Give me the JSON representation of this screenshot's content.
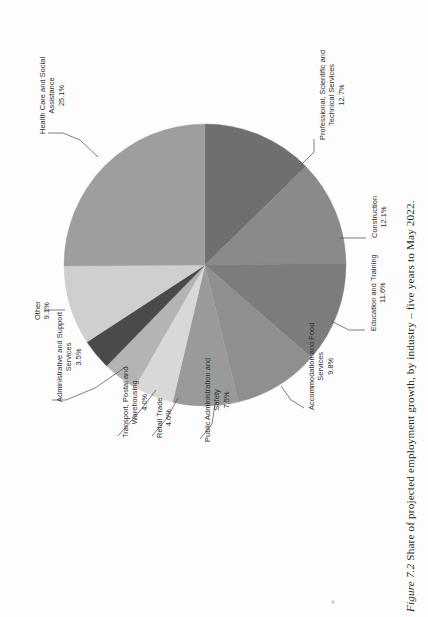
{
  "figure": {
    "caption_number": "Figure 7.2",
    "caption_text": "Share of projected employment growth, by industry – five years to May 2022."
  },
  "chart_data": {
    "type": "pie",
    "title": "Share of projected employment growth, by industry – five years to May 2022.",
    "xlabel": "",
    "ylabel": "",
    "units": "percent",
    "legend_position": "none",
    "labels_position": "outside-with-leader-lines",
    "grid": false,
    "rotation_deg": -90,
    "categories": [
      "Professional, Scientific and Technical Services",
      "Construction",
      "Education and Training",
      "Accommodation and Food Services",
      "Public Administration and Safety",
      "Retail Trade",
      "Transport, Postal and Warehousing",
      "Administrative and Support Services",
      "Other",
      "Health Care and Social Assistance"
    ],
    "values": [
      12.7,
      12.1,
      11.6,
      9.8,
      7.5,
      4.6,
      4.0,
      3.5,
      9.1,
      25.1
    ],
    "value_labels": [
      "12.7%",
      "12.1%",
      "11.6%",
      "9.8%",
      "7.5%",
      "4.6%",
      "4.0%",
      "3.5%",
      "9.1%",
      "25.1%"
    ],
    "colors": [
      "#6f6f6f",
      "#8a8a8a",
      "#7c7c7c",
      "#8f8f8f",
      "#9a9a9a",
      "#d8d8d8",
      "#b4b4b4",
      "#4a4a4a",
      "#cfcfcf",
      "#9e9e9e"
    ],
    "slices": [
      {
        "label": "Professional, Scientific and Technical Services",
        "value": 12.7,
        "value_label": "12.7%",
        "color": "#6f6f6f"
      },
      {
        "label": "Construction",
        "value": 12.1,
        "value_label": "12.1%",
        "color": "#8a8a8a"
      },
      {
        "label": "Education and Training",
        "value": 11.6,
        "value_label": "11.6%",
        "color": "#7c7c7c"
      },
      {
        "label": "Accommodation and Food Services",
        "value": 9.8,
        "value_label": "9.8%",
        "color": "#8f8f8f"
      },
      {
        "label": "Public Administration and Safety",
        "value": 7.5,
        "value_label": "7.5%",
        "color": "#9a9a9a"
      },
      {
        "label": "Retail Trade",
        "value": 4.6,
        "value_label": "4.6%",
        "color": "#d8d8d8"
      },
      {
        "label": "Transport, Postal and Warehousing",
        "value": 4.0,
        "value_label": "4.0%",
        "color": "#b4b4b4"
      },
      {
        "label": "Administrative and Support Services",
        "value": 3.5,
        "value_label": "3.5%",
        "color": "#4a4a4a"
      },
      {
        "label": "Other",
        "value": 9.1,
        "value_label": "9.1%",
        "color": "#cfcfcf"
      },
      {
        "label": "Health Care and Social Assistance",
        "value": 25.1,
        "value_label": "25.1%",
        "color": "#9e9e9e"
      }
    ]
  },
  "labels": {
    "professional": {
      "line1": "Professional, Scientific and",
      "line2": "Technical Services",
      "pct": "12.7%"
    },
    "construction": {
      "line1": "Construction",
      "pct": "12.1%"
    },
    "education": {
      "line1": "Education and Training",
      "pct": "11.6%"
    },
    "accommodation": {
      "line1": "Accommodation and Food",
      "line2": "Services",
      "pct": "9.8%"
    },
    "public_admin": {
      "line1": "Public Administration and",
      "line2": "Safety",
      "pct": "7.5%"
    },
    "retail": {
      "line1": "Retail Trade",
      "pct": "4.6%"
    },
    "transport": {
      "line1": "Transport, Postal and",
      "line2": "Warehousing",
      "pct": "4.0%"
    },
    "admin_support": {
      "line1": "Administrative and Support",
      "line2": "Services",
      "pct": "3.5%"
    },
    "other": {
      "line1": "Other",
      "pct": "9.1%"
    },
    "health": {
      "line1": "Health Care and Social",
      "line2": "Assistance",
      "pct": "25.1%"
    }
  }
}
